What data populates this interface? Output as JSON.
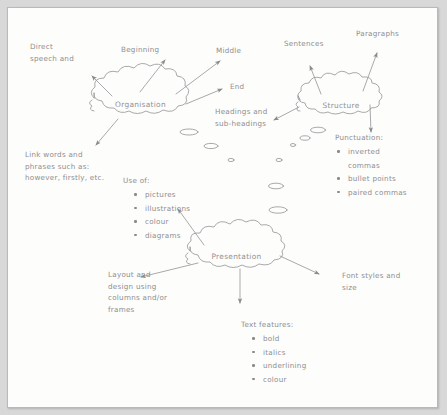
{
  "document": {
    "type": "hand-drawn mind map",
    "background_color": "#d8d8d8",
    "page_color": "#fdfdfc",
    "ink_color": "#8d8d90"
  },
  "nodes": [
    {
      "id": "organisation",
      "label": "Organisation"
    },
    {
      "id": "structure",
      "label": "Structure"
    },
    {
      "id": "presentation",
      "label": "Presentation"
    }
  ],
  "labels": {
    "direct_speech": "Direct\nspeech and",
    "beginning": "Beginning",
    "middle": "Middle",
    "end": "End",
    "headings": "Headings and\nsub-headings",
    "sentences": "Sentences",
    "paragraphs": "Paragraphs",
    "link_words": "Link words and\nphrases such as:\nhowever, firstly, etc.",
    "layout": "Layout and\ndesign using\ncolumns and/or\nframes",
    "font_styles": "Font styles and\nsize"
  },
  "lists": {
    "punctuation": {
      "head": "Punctuation:",
      "items": [
        "inverted",
        "commas",
        "bullet points",
        "paired commas"
      ],
      "rendered": [
        {
          "text": "inverted",
          "bullet": true
        },
        {
          "text": "commas",
          "bullet": false
        },
        {
          "text": "bullet points",
          "bullet": true
        },
        {
          "text": "paired commas",
          "bullet": true
        }
      ]
    },
    "use_of": {
      "head": "Use of:",
      "rendered": [
        {
          "text": "pictures",
          "bullet": true
        },
        {
          "text": "illustrations",
          "bullet": true
        },
        {
          "text": "colour",
          "bullet": true
        },
        {
          "text": "diagrams",
          "bullet": true
        }
      ]
    },
    "text_features": {
      "head": "Text features:",
      "rendered": [
        {
          "text": "bold",
          "bullet": true
        },
        {
          "text": "italics",
          "bullet": true
        },
        {
          "text": "underlining",
          "bullet": true
        },
        {
          "text": "colour",
          "bullet": true
        }
      ]
    }
  }
}
